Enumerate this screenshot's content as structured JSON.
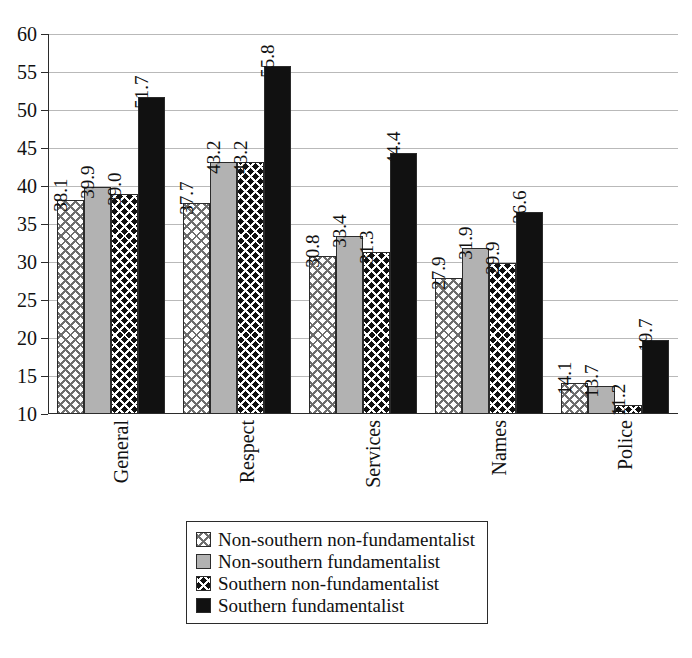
{
  "chart_data": {
    "type": "bar",
    "title": "",
    "xlabel": "",
    "ylabel": "",
    "ylim": [
      10,
      60
    ],
    "ytick_step": 5,
    "yticks": [
      60,
      55,
      50,
      45,
      40,
      35,
      30,
      25,
      20,
      15,
      10
    ],
    "grid": true,
    "legend_position": "bottom",
    "categories": [
      "General",
      "Respect",
      "Services",
      "Names",
      "Police"
    ],
    "series": [
      {
        "name": "Non-southern non-fundamentalist",
        "pattern": "light-diamond-lattice",
        "color": "#ffffff",
        "values": [
          38.1,
          37.7,
          30.8,
          27.9,
          14.1
        ]
      },
      {
        "name": "Non-southern fundamentalist",
        "pattern": "solid-gray",
        "color": "#b2b2b2",
        "values": [
          39.9,
          43.2,
          33.4,
          31.9,
          13.7
        ]
      },
      {
        "name": "Southern non-fundamentalist",
        "pattern": "dark-diamond-lattice",
        "color": "#111111",
        "values": [
          39.0,
          43.2,
          31.3,
          29.9,
          11.2
        ]
      },
      {
        "name": "Southern fundamentalist",
        "pattern": "solid-black",
        "color": "#111111",
        "values": [
          51.7,
          55.8,
          44.4,
          36.6,
          19.7
        ]
      }
    ]
  }
}
